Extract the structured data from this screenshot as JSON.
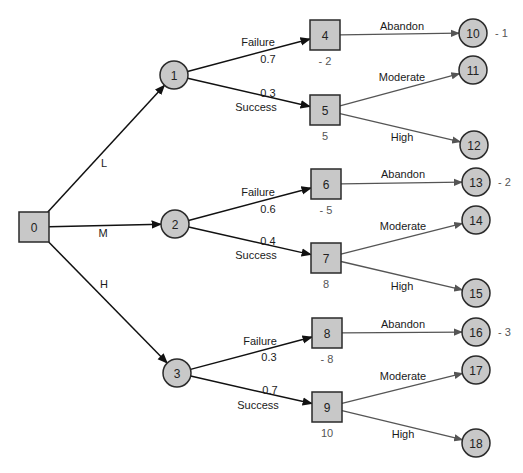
{
  "colors": {
    "node_fill": "#c8c8c8",
    "node_stroke": "#2a2a2a",
    "edge_dark": "#111111",
    "edge_gray": "#555555",
    "value_text": "#555555"
  },
  "nodes": [
    {
      "id": "0",
      "type": "decision",
      "label": "0",
      "x": 34,
      "y": 227
    },
    {
      "id": "1",
      "type": "chance",
      "label": "1",
      "x": 174,
      "y": 75
    },
    {
      "id": "2",
      "type": "chance",
      "label": "2",
      "x": 175,
      "y": 224
    },
    {
      "id": "3",
      "type": "chance",
      "label": "3",
      "x": 177,
      "y": 373
    },
    {
      "id": "4",
      "type": "decision",
      "label": "4",
      "x": 325,
      "y": 35,
      "value": "- 2"
    },
    {
      "id": "5",
      "type": "decision",
      "label": "5",
      "x": 325,
      "y": 110,
      "value": "5"
    },
    {
      "id": "6",
      "type": "decision",
      "label": "6",
      "x": 326,
      "y": 184,
      "value": "- 5"
    },
    {
      "id": "7",
      "type": "decision",
      "label": "7",
      "x": 326,
      "y": 258,
      "value": "8"
    },
    {
      "id": "8",
      "type": "decision",
      "label": "8",
      "x": 327,
      "y": 333,
      "value": "- 8"
    },
    {
      "id": "9",
      "type": "decision",
      "label": "9",
      "x": 327,
      "y": 407,
      "value": "10"
    },
    {
      "id": "10",
      "type": "terminal",
      "label": "10",
      "x": 473,
      "y": 33,
      "value": "- 1"
    },
    {
      "id": "11",
      "type": "terminal",
      "label": "11",
      "x": 473,
      "y": 70
    },
    {
      "id": "12",
      "type": "terminal",
      "label": "12",
      "x": 474,
      "y": 145
    },
    {
      "id": "13",
      "type": "terminal",
      "label": "13",
      "x": 476,
      "y": 182,
      "value": "- 2"
    },
    {
      "id": "14",
      "type": "terminal",
      "label": "14",
      "x": 476,
      "y": 220
    },
    {
      "id": "15",
      "type": "terminal",
      "label": "15",
      "x": 476,
      "y": 293
    },
    {
      "id": "16",
      "type": "terminal",
      "label": "16",
      "x": 476,
      "y": 332,
      "value": "- 3"
    },
    {
      "id": "17",
      "type": "terminal",
      "label": "17",
      "x": 476,
      "y": 370
    },
    {
      "id": "18",
      "type": "terminal",
      "label": "18",
      "x": 476,
      "y": 443
    }
  ],
  "edges": [
    {
      "from": "0",
      "to": "1",
      "label": "L",
      "style": "dark"
    },
    {
      "from": "0",
      "to": "2",
      "label": "M",
      "style": "dark"
    },
    {
      "from": "0",
      "to": "3",
      "label": "H",
      "style": "dark"
    },
    {
      "from": "1",
      "to": "4",
      "label": "Failure",
      "prob": "0.7",
      "style": "dark"
    },
    {
      "from": "1",
      "to": "5",
      "label": "Success",
      "prob": "0.3",
      "style": "dark"
    },
    {
      "from": "2",
      "to": "6",
      "label": "Failure",
      "prob": "0.6",
      "style": "dark"
    },
    {
      "from": "2",
      "to": "7",
      "label": "Success",
      "prob": "0.4",
      "style": "dark"
    },
    {
      "from": "3",
      "to": "8",
      "label": "Failure",
      "prob": "0.3",
      "style": "dark"
    },
    {
      "from": "3",
      "to": "9",
      "label": "Success",
      "prob": "0.7",
      "style": "dark"
    },
    {
      "from": "4",
      "to": "10",
      "label": "Abandon",
      "style": "gray"
    },
    {
      "from": "5",
      "to": "11",
      "label": "Moderate",
      "style": "gray"
    },
    {
      "from": "5",
      "to": "12",
      "label": "High",
      "style": "gray"
    },
    {
      "from": "6",
      "to": "13",
      "label": "Abandon",
      "style": "gray"
    },
    {
      "from": "7",
      "to": "14",
      "label": "Moderate",
      "style": "gray"
    },
    {
      "from": "7",
      "to": "15",
      "label": "High",
      "style": "gray"
    },
    {
      "from": "8",
      "to": "16",
      "label": "Abandon",
      "style": "gray"
    },
    {
      "from": "9",
      "to": "17",
      "label": "Moderate",
      "style": "gray"
    },
    {
      "from": "9",
      "to": "18",
      "label": "High",
      "style": "gray"
    }
  ],
  "edge_labels": [
    {
      "text": "L",
      "x": 104,
      "y": 167
    },
    {
      "text": "M",
      "x": 103,
      "y": 237
    },
    {
      "text": "H",
      "x": 104,
      "y": 288
    },
    {
      "text": "Failure",
      "x": 258,
      "y": 46
    },
    {
      "text": "0.7",
      "x": 268,
      "y": 63
    },
    {
      "text": "0.3",
      "x": 268,
      "y": 97
    },
    {
      "text": "Success",
      "x": 256,
      "y": 111
    },
    {
      "text": "Failure",
      "x": 258,
      "y": 196
    },
    {
      "text": "0.6",
      "x": 268,
      "y": 213
    },
    {
      "text": "0.4",
      "x": 268,
      "y": 245
    },
    {
      "text": "Success",
      "x": 256,
      "y": 259
    },
    {
      "text": "Failure",
      "x": 260,
      "y": 345
    },
    {
      "text": "0.3",
      "x": 269,
      "y": 361
    },
    {
      "text": "0.7",
      "x": 270,
      "y": 394
    },
    {
      "text": "Success",
      "x": 258,
      "y": 409
    },
    {
      "text": "Abandon",
      "x": 402,
      "y": 30
    },
    {
      "text": "Moderate",
      "x": 402,
      "y": 81
    },
    {
      "text": "High",
      "x": 402,
      "y": 141
    },
    {
      "text": "Abandon",
      "x": 403,
      "y": 178
    },
    {
      "text": "Moderate",
      "x": 403,
      "y": 230
    },
    {
      "text": "High",
      "x": 402,
      "y": 290
    },
    {
      "text": "Abandon",
      "x": 403,
      "y": 328
    },
    {
      "text": "Moderate",
      "x": 403,
      "y": 380
    },
    {
      "text": "High",
      "x": 403,
      "y": 438
    }
  ]
}
